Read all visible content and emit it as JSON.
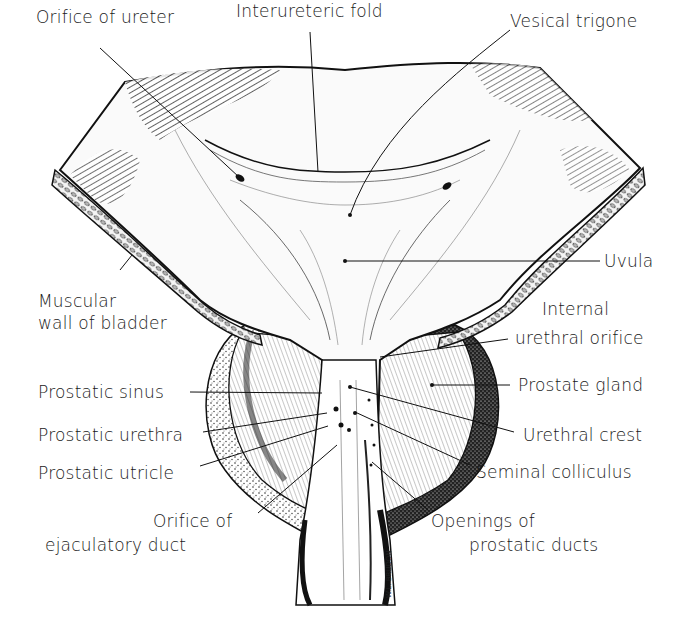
{
  "diagram": {
    "signature": "W.L. BRUDON",
    "colors": {
      "ink": "#1a1a1a",
      "background": "#ffffff",
      "shade": "#333333"
    },
    "labels": [
      {
        "id": "orifice-of-ureter",
        "text": "Orifice of ureter"
      },
      {
        "id": "interureteric-fold",
        "text": "Interureteric fold"
      },
      {
        "id": "vesical-trigone",
        "text": "Vesical trigone"
      },
      {
        "id": "uvula",
        "text": "Uvula"
      },
      {
        "id": "muscular-wall-of-bladder",
        "line1": "Muscular",
        "line2": "wall of bladder"
      },
      {
        "id": "internal-urethral-orifice",
        "line1": "Internal",
        "line2": "urethral orifice"
      },
      {
        "id": "prostatic-sinus",
        "text": "Prostatic sinus"
      },
      {
        "id": "prostate-gland",
        "text": "Prostate gland"
      },
      {
        "id": "prostatic-urethra",
        "text": "Prostatic urethra"
      },
      {
        "id": "urethral-crest",
        "text": "Urethral crest"
      },
      {
        "id": "prostatic-utricle",
        "text": "Prostatic utricle"
      },
      {
        "id": "seminal-colliculus",
        "text": "Seminal colliculus"
      },
      {
        "id": "orifice-of-ejaculatory-duct",
        "line1": "Orifice of",
        "line2": "ejaculatory duct"
      },
      {
        "id": "openings-of-prostatic-ducts",
        "line1": "Openings of",
        "line2": "prostatic ducts"
      }
    ]
  }
}
